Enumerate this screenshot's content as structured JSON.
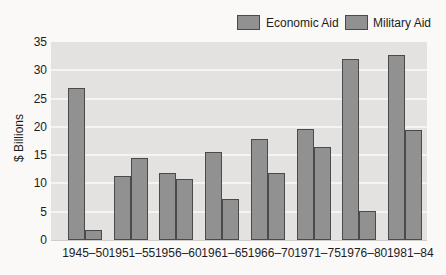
{
  "chart_data": {
    "type": "bar",
    "title": "",
    "xlabel": "",
    "ylabel": "$ Billions",
    "categories": [
      "1945–50",
      "1951–55",
      "1956–60",
      "1961–65",
      "1966–70",
      "1971–75",
      "1976–80",
      "1981–84"
    ],
    "series": [
      {
        "name": "Economic Aid",
        "values": [
          26.9,
          11.4,
          11.9,
          15.5,
          17.8,
          19.7,
          32.0,
          32.7
        ]
      },
      {
        "name": "Military Aid",
        "values": [
          1.8,
          14.5,
          10.8,
          7.3,
          11.8,
          16.5,
          5.2,
          19.5
        ]
      }
    ],
    "ylim": [
      0,
      35
    ],
    "yticks": [
      0,
      5,
      10,
      15,
      20,
      25,
      30,
      35
    ],
    "grid": true,
    "legend_position": "top-right",
    "colors": {
      "bar_fill": "#919191",
      "bar_border": "#4a4a4a",
      "plot_bg": "#e3e2e0",
      "gridline": "#f5f4f1",
      "text": "#1d1d1d",
      "page_bg": "#faf9f7"
    }
  }
}
